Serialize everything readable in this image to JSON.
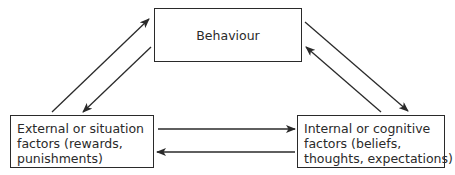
{
  "diagram": {
    "nodes": {
      "behaviour": {
        "label": "Behaviour"
      },
      "external": {
        "lines": [
          "External or situation",
          "factors (rewards,",
          "punishments)"
        ]
      },
      "internal": {
        "lines": [
          "Internal or cognitive",
          "factors (beliefs,",
          "thoughts, expectations)"
        ]
      }
    },
    "edges": [
      {
        "from": "external",
        "to": "behaviour"
      },
      {
        "from": "behaviour",
        "to": "external"
      },
      {
        "from": "behaviour",
        "to": "internal"
      },
      {
        "from": "internal",
        "to": "behaviour"
      },
      {
        "from": "external",
        "to": "internal"
      },
      {
        "from": "internal",
        "to": "external"
      }
    ],
    "colors": {
      "stroke": "#2a2a2a",
      "background": "#ffffff"
    }
  }
}
